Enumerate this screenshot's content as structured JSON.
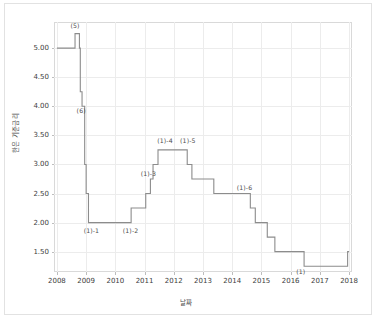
{
  "figure": {
    "source_note": "자료출처 : 한국은행",
    "background_color": "#ffffff",
    "frame_color": "#e2e2e2"
  },
  "chart_data": {
    "type": "line",
    "title": "",
    "subtitle": "",
    "xlabel": "날짜",
    "ylabel": "한은 기준금리",
    "line_style": "step-post",
    "line_color": "#8c8c8c",
    "grid": true,
    "legend": "none",
    "xlim": [
      2007.9,
      2018.1
    ],
    "ylim": [
      1.15,
      5.45
    ],
    "xticks": [
      2008,
      2009,
      2010,
      2011,
      2012,
      2013,
      2014,
      2015,
      2016,
      2017,
      2018
    ],
    "xtick_labels": [
      "2008",
      "2009",
      "2010",
      "2011",
      "2012",
      "2013",
      "2014",
      "2015",
      "2016",
      "2017",
      "2018"
    ],
    "yticks": [
      1.5,
      2.0,
      2.5,
      3.0,
      3.5,
      4.0,
      4.5,
      5.0
    ],
    "ytick_labels": [
      "1.50",
      "2.00",
      "2.50",
      "3.00",
      "3.50",
      "4.00",
      "4.50",
      "5.00"
    ],
    "series": [
      {
        "name": "한은 기준금리",
        "x": [
          2008.0,
          2008.62,
          2008.77,
          2008.8,
          2008.86,
          2008.95,
          2009.0,
          2009.08,
          2010.54,
          2011.04,
          2011.2,
          2011.29,
          2011.46,
          2012.46,
          2012.62,
          2013.37,
          2014.62,
          2014.79,
          2015.2,
          2015.46,
          2016.46,
          2017.95,
          2018.0
        ],
        "y": [
          5.0,
          5.25,
          5.0,
          4.25,
          4.0,
          3.0,
          2.5,
          2.0,
          2.25,
          2.5,
          2.75,
          3.0,
          3.25,
          3.0,
          2.75,
          2.5,
          2.25,
          2.0,
          1.75,
          1.5,
          1.25,
          1.5,
          1.5
        ]
      }
    ],
    "annotations": [
      {
        "text": "(5)",
        "x": 2008.62,
        "y": 5.4
      },
      {
        "text": "(6)",
        "x": 2008.83,
        "y": 3.93
      },
      {
        "text": "(1)-1",
        "x": 2009.18,
        "y": 1.88
      },
      {
        "text": "(1)-2",
        "x": 2010.52,
        "y": 1.88
      },
      {
        "text": "(1)-3",
        "x": 2011.13,
        "y": 2.86
      },
      {
        "text": "(1)-4",
        "x": 2011.7,
        "y": 3.42
      },
      {
        "text": "(1)-5",
        "x": 2012.48,
        "y": 3.42
      },
      {
        "text": "(1)-6",
        "x": 2014.42,
        "y": 2.62
      },
      {
        "text": "(1)",
        "x": 2016.35,
        "y": 1.17
      }
    ]
  }
}
